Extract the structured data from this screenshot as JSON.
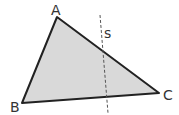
{
  "diagram": {
    "type": "geometry-triangle",
    "fill_color": "#d9d9d9",
    "stroke_color": "#222222",
    "vertices": [
      {
        "label": "A",
        "x": 57,
        "y": 17
      },
      {
        "label": "B",
        "x": 22,
        "y": 103
      },
      {
        "label": "C",
        "x": 159,
        "y": 93
      }
    ],
    "line": {
      "label": "s",
      "style": "dashed"
    }
  }
}
